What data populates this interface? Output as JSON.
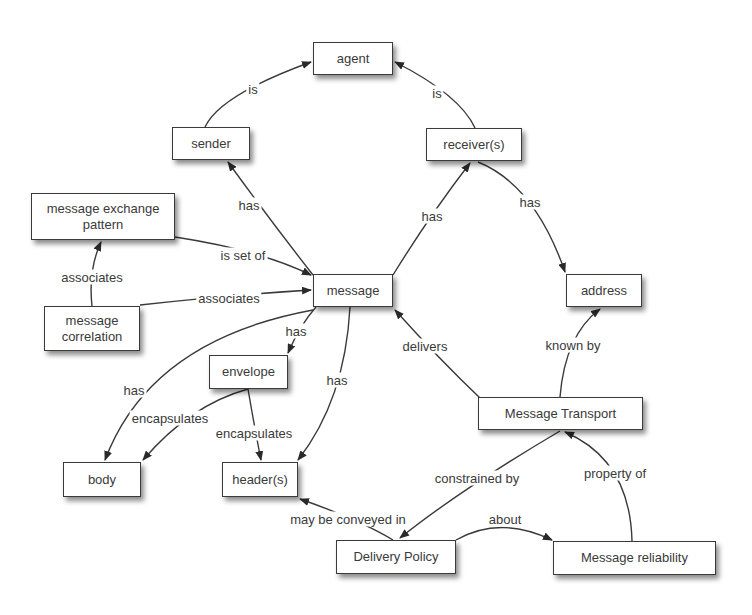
{
  "diagram": {
    "type": "concept-map",
    "colors": {
      "background": "#ffffff",
      "stroke": "#3a3a3a",
      "text": "#3a3a3a"
    },
    "nodes": [
      {
        "id": "agent",
        "label": "agent",
        "x": 313,
        "y": 42,
        "w": 80,
        "h": 33
      },
      {
        "id": "sender",
        "label": "sender",
        "x": 172,
        "y": 127,
        "w": 78,
        "h": 33
      },
      {
        "id": "receivers",
        "label": "receiver(s)",
        "x": 426,
        "y": 128,
        "w": 96,
        "h": 33
      },
      {
        "id": "mep",
        "label": "message exchange\npattern",
        "x": 31,
        "y": 193,
        "w": 144,
        "h": 47
      },
      {
        "id": "message",
        "label": "message",
        "x": 313,
        "y": 274,
        "w": 80,
        "h": 33
      },
      {
        "id": "address",
        "label": "address",
        "x": 566,
        "y": 274,
        "w": 76,
        "h": 33
      },
      {
        "id": "correlation",
        "label": "message\ncorrelation",
        "x": 44,
        "y": 306,
        "w": 96,
        "h": 45
      },
      {
        "id": "envelope",
        "label": "envelope",
        "x": 209,
        "y": 355,
        "w": 79,
        "h": 34
      },
      {
        "id": "transport",
        "label": "Message Transport",
        "x": 478,
        "y": 397,
        "w": 165,
        "h": 33
      },
      {
        "id": "body",
        "label": "body",
        "x": 63,
        "y": 462,
        "w": 78,
        "h": 35
      },
      {
        "id": "headers",
        "label": "header(s)",
        "x": 222,
        "y": 462,
        "w": 76,
        "h": 35
      },
      {
        "id": "policy",
        "label": "Delivery Policy",
        "x": 336,
        "y": 540,
        "w": 120,
        "h": 34
      },
      {
        "id": "reliability",
        "label": "Message reliability",
        "x": 553,
        "y": 541,
        "w": 163,
        "h": 34
      }
    ],
    "edges": [
      {
        "from": "sender",
        "to": "agent",
        "label": "is",
        "lx": 253,
        "ly": 89,
        "path": "M 205 127 Q 220 95 311 62"
      },
      {
        "from": "receivers",
        "to": "agent",
        "label": "is",
        "lx": 437,
        "ly": 93,
        "path": "M 475 128 Q 460 95 395 62"
      },
      {
        "from": "message",
        "to": "sender",
        "label": "has",
        "lx": 249,
        "ly": 205,
        "path": "M 313 275 Q 270 220 228 162"
      },
      {
        "from": "message",
        "to": "receivers",
        "label": "has",
        "lx": 432,
        "ly": 216,
        "path": "M 393 275 Q 430 215 470 163"
      },
      {
        "from": "receivers",
        "to": "address",
        "label": "has",
        "lx": 530,
        "ly": 202,
        "path": "M 478 162 Q 535 185 565 272"
      },
      {
        "from": "mep",
        "to": "message",
        "label": "is set of",
        "lx": 243,
        "ly": 255,
        "path": "M 175 237 Q 260 250 311 275"
      },
      {
        "from": "correlation",
        "to": "message",
        "label": "associates",
        "lx": 229,
        "ly": 298,
        "path": "M 140 305 Q 230 295 311 290"
      },
      {
        "from": "correlation",
        "to": "mep",
        "label": "associates",
        "lx": 92,
        "ly": 277,
        "path": "M 92 306 Q 88 270 101 242"
      },
      {
        "from": "message",
        "to": "envelope",
        "label": "has",
        "lx": 296,
        "ly": 331,
        "path": "M 316 307 Q 300 325 288 353"
      },
      {
        "from": "message",
        "to": "body",
        "label": "has",
        "lx": 134,
        "ly": 390,
        "path": "M 313 310 Q 150 340 105 460"
      },
      {
        "from": "message",
        "to": "headers",
        "label": "has",
        "lx": 337,
        "ly": 380,
        "path": "M 350 307 Q 345 400 298 460"
      },
      {
        "from": "envelope",
        "to": "body",
        "label": "encapsulates",
        "lx": 170,
        "ly": 418,
        "path": "M 248 389 Q 190 405 143 460"
      },
      {
        "from": "envelope",
        "to": "headers",
        "label": "encapsulates",
        "lx": 254,
        "ly": 433,
        "path": "M 248 389 Q 255 430 261 460"
      },
      {
        "from": "transport",
        "to": "message",
        "label": "delivers",
        "lx": 425,
        "ly": 346,
        "path": "M 480 398 Q 440 360 395 310"
      },
      {
        "from": "transport",
        "to": "address",
        "label": "known by",
        "lx": 573,
        "ly": 345,
        "path": "M 560 397 Q 565 335 600 309"
      },
      {
        "from": "transport",
        "to": "policy",
        "label": "constrained by",
        "lx": 477,
        "ly": 478,
        "path": "M 560 431 Q 460 490 400 538"
      },
      {
        "from": "reliability",
        "to": "transport",
        "label": "property of",
        "lx": 615,
        "ly": 473,
        "path": "M 632 541 Q 630 460 565 432"
      },
      {
        "from": "policy",
        "to": "reliability",
        "label": "about",
        "lx": 505,
        "ly": 519,
        "path": "M 456 540 Q 500 515 552 540"
      },
      {
        "from": "policy",
        "to": "headers",
        "label": "may be conveyed in",
        "lx": 348,
        "ly": 519,
        "path": "M 393 540 Q 360 520 300 499"
      }
    ]
  }
}
